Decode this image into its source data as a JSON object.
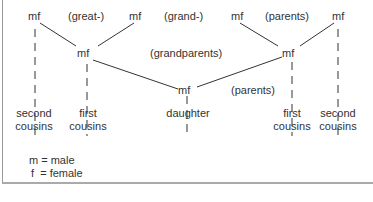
{
  "diagram": {
    "nodes": {
      "ggp_left": "mf",
      "ggp_mid_left": "mf",
      "ggp_mid_right": "mf",
      "ggp_right": "mf",
      "gp_left": "mf",
      "gp_right": "mf",
      "parent": "mf"
    },
    "generation_labels": {
      "great": "(great-)",
      "grand": "(grand-)",
      "parents_top": "(parents)",
      "grandparents": "(grandparents)",
      "parents": "(parents)"
    },
    "bottom_labels": {
      "second_cousins_left_1": "second",
      "second_cousins_left_2": "cousins",
      "first_cousins_left_1": "first",
      "first_cousins_left_2": "cousins",
      "daughter": "daughter",
      "first_cousins_right_1": "first",
      "first_cousins_right_2": "cousins",
      "second_cousins_right_1": "second",
      "second_cousins_right_2": "cousins"
    },
    "legend": {
      "male": "m = male",
      "female": "f  = female"
    }
  },
  "colors": {
    "line": "#333333",
    "border": "#999999"
  }
}
